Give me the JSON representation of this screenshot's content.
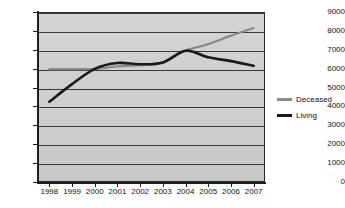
{
  "chart_data": {
    "type": "line",
    "title": "",
    "xlabel": "",
    "ylabel": "",
    "x": [
      "1998",
      "1999",
      "2000",
      "2001",
      "2002",
      "2003",
      "2004",
      "2005",
      "2006",
      "2007"
    ],
    "categories": [
      "1998",
      "1999",
      "2000",
      "2001",
      "2002",
      "2003",
      "2004",
      "2005",
      "2006",
      "2007"
    ],
    "ylim": [
      0,
      9000
    ],
    "xlim_labels": [
      "1998",
      "2007"
    ],
    "y_ticks": [
      0,
      1000,
      2000,
      3000,
      4000,
      5000,
      6000,
      7000,
      8000,
      9000
    ],
    "y_tick_labels": [
      "0",
      "1000",
      "2000",
      "3000",
      "4000",
      "5000",
      "6000",
      "7000",
      "8000",
      "9000"
    ],
    "grid": true,
    "grid_axis": "y",
    "legend_position": "right",
    "series": [
      {
        "name": "Deceased",
        "color": "#8a8a8a",
        "values": [
          5980,
          5980,
          5990,
          6120,
          6180,
          6320,
          6950,
          7300,
          7750,
          8150
        ]
      },
      {
        "name": "Living",
        "color": "#1a1a1a",
        "values": [
          4250,
          5180,
          5990,
          6300,
          6230,
          6330,
          6950,
          6600,
          6400,
          6150
        ]
      }
    ]
  },
  "axes": {
    "y_tick_labels": [
      "9000",
      "8000",
      "7000",
      "6000",
      "5000",
      "4000",
      "3000",
      "2000",
      "1000",
      "0"
    ],
    "x_tick_labels": [
      "1998",
      "1999",
      "2000",
      "2001",
      "2002",
      "2003",
      "2004",
      "2005",
      "2006",
      "2007"
    ]
  },
  "legend": {
    "items": [
      {
        "label": "Deceased",
        "color": "#8a8a8a"
      },
      {
        "label": "Living",
        "color": "#1a1a1a"
      }
    ]
  },
  "style": {
    "plot_background": "#d0d0d0",
    "gridline_color": "#3a3a3a",
    "axis_color": "#1d1d1d",
    "text_color": "#111111",
    "page_background": "#ffffff"
  }
}
